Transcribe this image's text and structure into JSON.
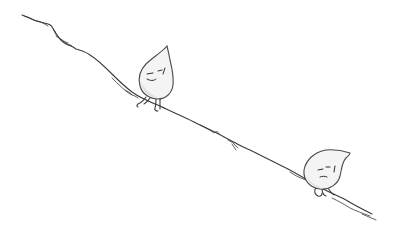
{
  "illustration": {
    "description": "Pencil sketch of two water-droplet characters on a long downhill slope",
    "background": "#ffffff",
    "stroke_color": "#3a3a3a",
    "characters": [
      {
        "name": "upper-droplet",
        "pose": "walking downhill, standing on two legs",
        "expression": "smiling, eyes half closed"
      },
      {
        "name": "lower-droplet",
        "pose": "slumped, leaning on the slope",
        "expression": "tired, eyes closed"
      }
    ]
  }
}
